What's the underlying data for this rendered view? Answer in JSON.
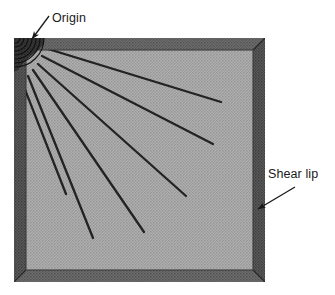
{
  "figure": {
    "kind": "fracture-surface-diagram",
    "width": 335,
    "height": 295
  },
  "annotations": [
    {
      "id": "origin",
      "label": "Origin",
      "label_x": 52,
      "label_y": 18,
      "arrow": {
        "x1": 49,
        "y1": 16,
        "x2": 32,
        "y2": 39
      }
    },
    {
      "id": "shear-lip",
      "label": "Shear lip",
      "label_x": 268,
      "label_y": 180,
      "arrow": {
        "x1": 295,
        "y1": 187,
        "x2": 258,
        "y2": 209
      }
    }
  ],
  "specimen": {
    "outer": {
      "x": 14,
      "y": 38,
      "width": 251,
      "height": 244
    },
    "band_width": 12,
    "colors": {
      "shear_lip_dark": "#4a4a4a",
      "shear_lip_light": "#6e6e6e",
      "interior_gray": "#a9a9a9",
      "interior_speckle": "#8f8f8f",
      "line_color": "#262626",
      "label_color": "#1a1a1a",
      "background": "#ffffff"
    }
  },
  "beach_marks": {
    "description": "concentric arcs at origin corner",
    "center_x": 15,
    "center_y": 39,
    "radii": [
      5,
      9,
      13,
      17,
      21,
      25,
      29
    ]
  },
  "ratchet_marks": {
    "count": 6,
    "lines": [
      {
        "x1": 48,
        "y1": 49,
        "x2": 221,
        "y2": 102
      },
      {
        "x1": 42,
        "y1": 56,
        "x2": 213,
        "y2": 144
      },
      {
        "x1": 38,
        "y1": 64,
        "x2": 186,
        "y2": 196
      },
      {
        "x1": 33,
        "y1": 70,
        "x2": 144,
        "y2": 232
      },
      {
        "x1": 28,
        "y1": 76,
        "x2": 93,
        "y2": 238
      },
      {
        "x1": 22,
        "y1": 82,
        "x2": 66,
        "y2": 194
      }
    ]
  }
}
